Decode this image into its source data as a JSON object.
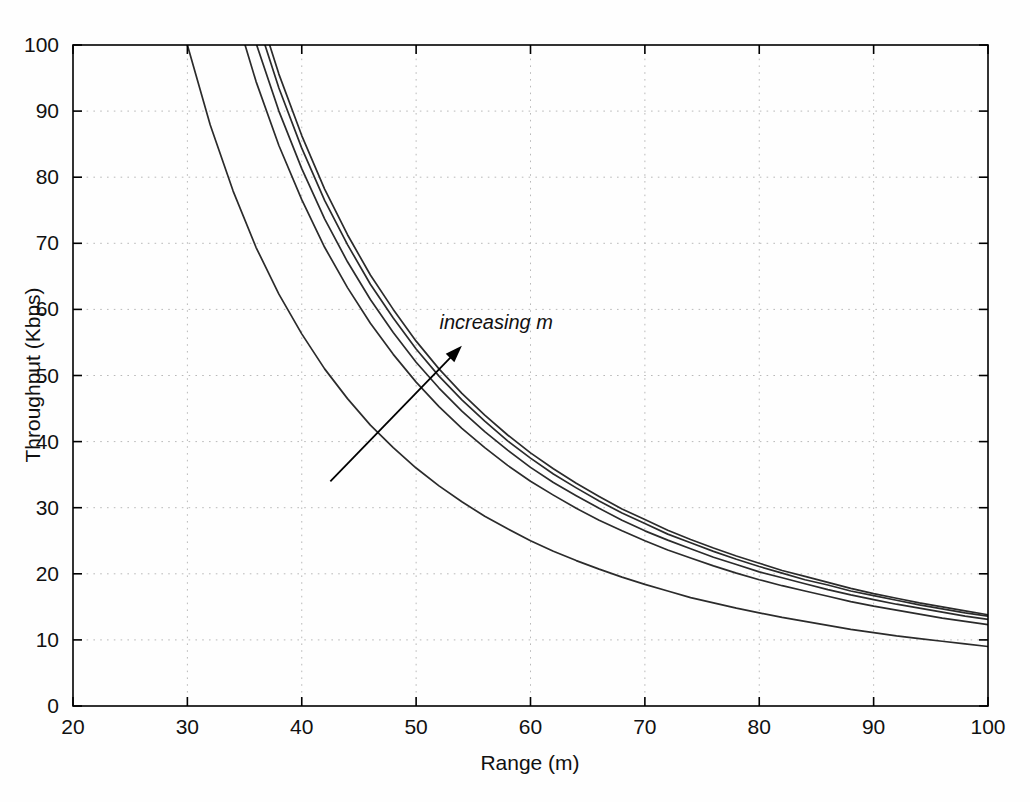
{
  "chart_data": {
    "type": "line",
    "title": "",
    "xlabel": "Range (m)",
    "ylabel": "Throughput (Kbps)",
    "xlim": [
      20,
      100
    ],
    "ylim": [
      0,
      100
    ],
    "xticks": [
      20,
      30,
      40,
      50,
      60,
      70,
      80,
      90,
      100
    ],
    "yticks": [
      0,
      10,
      20,
      30,
      40,
      50,
      60,
      70,
      80,
      90,
      100
    ],
    "xticklabels": [
      "20",
      "30",
      "40",
      "50",
      "60",
      "70",
      "80",
      "90",
      "100"
    ],
    "yticklabels": [
      "0",
      "10",
      "20",
      "30",
      "40",
      "50",
      "60",
      "70",
      "80",
      "90",
      "100"
    ],
    "grid": true,
    "grid_style": "dotted",
    "legend": "none",
    "annotations": [
      {
        "text": "increasing  m",
        "x": 57,
        "y": 57,
        "style": "italic",
        "arrow_from": [
          42.5,
          34
        ],
        "arrow_to": [
          54.0,
          54.5
        ]
      }
    ],
    "x": [
      20,
      22,
      24,
      26,
      28,
      30,
      32,
      34,
      36,
      38,
      40,
      42,
      44,
      46,
      48,
      50,
      52,
      54,
      56,
      58,
      60,
      62,
      64,
      66,
      68,
      70,
      72,
      74,
      76,
      78,
      80,
      82,
      84,
      86,
      88,
      90,
      92,
      94,
      96,
      98,
      100
    ],
    "series": [
      {
        "name": "m = 1",
        "values": [
          225.0,
          186.0,
          156.3,
          133.1,
          114.8,
          100.0,
          87.9,
          77.9,
          69.4,
          62.3,
          56.3,
          51.0,
          46.5,
          42.5,
          39.1,
          36.0,
          33.3,
          30.9,
          28.7,
          26.8,
          25.0,
          23.4,
          22.0,
          20.7,
          19.5,
          18.4,
          17.4,
          16.4,
          15.6,
          14.8,
          14.1,
          13.4,
          12.8,
          12.2,
          11.6,
          11.1,
          10.6,
          10.2,
          9.8,
          9.4,
          9.0
        ],
        "visible_values": [
          100.0,
          87.9,
          77.9,
          69.4,
          62.3,
          56.3,
          51.0,
          46.5,
          42.5,
          39.1,
          36.0,
          33.3,
          30.9,
          28.7,
          26.8,
          25.0,
          23.4,
          22.0,
          20.7,
          19.5,
          18.4,
          17.4,
          16.4,
          15.6,
          14.8,
          14.1,
          13.4,
          12.8,
          12.2,
          11.6,
          11.1,
          10.6,
          10.2,
          9.8,
          9.4,
          9.0
        ]
      },
      {
        "name": "m = 2",
        "values": [
          306.3,
          253.1,
          212.7,
          181.1,
          156.3,
          136.1,
          119.6,
          106.0,
          94.5,
          84.8,
          76.6,
          69.4,
          63.3,
          57.9,
          53.2,
          49.0,
          45.3,
          42.0,
          39.1,
          36.4,
          34.0,
          31.9,
          29.9,
          28.1,
          26.5,
          25.0,
          23.6,
          22.4,
          21.2,
          20.1,
          19.1,
          18.2,
          17.4,
          16.6,
          15.8,
          15.1,
          14.5,
          13.9,
          13.3,
          12.8,
          12.3
        ]
      },
      {
        "name": "m = 3",
        "values": [
          325.0,
          268.6,
          225.7,
          192.2,
          165.8,
          144.4,
          126.9,
          112.5,
          100.3,
          90.0,
          81.3,
          73.7,
          67.2,
          61.5,
          56.5,
          52.0,
          48.1,
          44.6,
          41.5,
          38.7,
          36.1,
          33.8,
          31.8,
          29.9,
          28.1,
          26.5,
          25.1,
          23.8,
          22.5,
          21.4,
          20.3,
          19.4,
          18.5,
          17.6,
          16.8,
          16.1,
          15.4,
          14.8,
          14.2,
          13.6,
          13.1
        ]
      },
      {
        "name": "m = 4",
        "values": [
          337.5,
          278.9,
          234.4,
          199.6,
          172.2,
          150.0,
          131.8,
          116.8,
          104.2,
          93.5,
          84.4,
          76.5,
          69.8,
          63.8,
          58.7,
          54.0,
          49.9,
          46.3,
          43.1,
          40.1,
          37.5,
          35.1,
          33.0,
          31.0,
          29.2,
          27.6,
          26.0,
          24.7,
          23.4,
          22.2,
          21.1,
          20.1,
          19.1,
          18.3,
          17.4,
          16.7,
          16.0,
          15.3,
          14.7,
          14.1,
          13.6
        ]
      },
      {
        "name": "m = 5",
        "values": [
          345.0,
          285.1,
          239.6,
          204.1,
          176.0,
          153.3,
          134.8,
          119.4,
          106.5,
          95.6,
          86.3,
          78.2,
          71.3,
          65.2,
          60.0,
          55.2,
          51.0,
          47.3,
          44.0,
          41.0,
          38.3,
          35.9,
          33.7,
          31.7,
          29.8,
          28.2,
          26.6,
          25.2,
          23.9,
          22.7,
          21.6,
          20.5,
          19.6,
          18.7,
          17.8,
          17.0,
          16.3,
          15.6,
          15.0,
          14.4,
          13.8
        ]
      }
    ],
    "endpoint_values_at_100": [
      5.0,
      6.6,
      7.0,
      7.3,
      7.5
    ],
    "curve_count": 5,
    "crossings_at_ymax": [
      30.0,
      35.1,
      36.0,
      36.5,
      37.0
    ]
  },
  "axes": {
    "x_title": "Range (m)",
    "y_title": "Throughput (Kbps)"
  }
}
